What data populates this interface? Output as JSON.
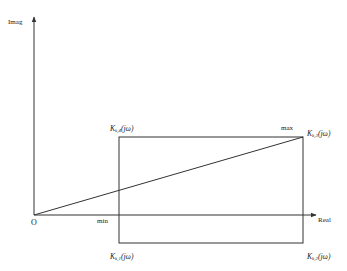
{
  "diagram": {
    "type": "complex-plane uncertainty rectangle",
    "axes": {
      "y_label": "Imag",
      "x_label": "Real",
      "origin_label": "O"
    },
    "markers": {
      "min_label": "min",
      "max_label": "max"
    },
    "vertices": [
      {
        "id": "k1",
        "position": "bottom-left",
        "base": "K",
        "sub": "k,1",
        "arg": "(jω)"
      },
      {
        "id": "k2",
        "position": "bottom-right",
        "base": "K",
        "sub": "k,2",
        "arg": "(jω)"
      },
      {
        "id": "k3",
        "position": "top-right",
        "base": "K",
        "sub": "k,3",
        "arg": "(jω)"
      },
      {
        "id": "k4",
        "position": "top-left",
        "base": "K",
        "sub": "k,4",
        "arg": "(jω)"
      }
    ],
    "colors": {
      "line": "#333333",
      "background": "#ffffff"
    }
  }
}
